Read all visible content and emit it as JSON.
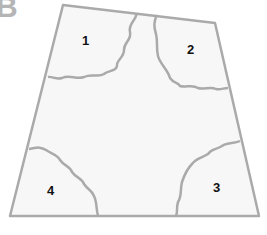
{
  "panel": {
    "letter": "B"
  },
  "diagram": {
    "shape": "trapezoid",
    "regions": [
      {
        "id": 1,
        "label": "1",
        "position": "top-left"
      },
      {
        "id": 2,
        "label": "2",
        "position": "top-right"
      },
      {
        "id": 3,
        "label": "3",
        "position": "bottom-right"
      },
      {
        "id": 4,
        "label": "4",
        "position": "bottom-left"
      }
    ],
    "colors": {
      "fill": "#f7f7f7",
      "stroke": "#aaaaaa",
      "label": "#111111"
    }
  }
}
